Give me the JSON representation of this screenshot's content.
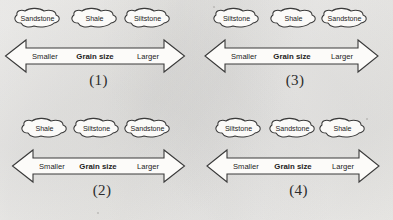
{
  "figure": {
    "background_color": "#f2f1ef",
    "ink_color": "#3a3a3a"
  },
  "axis_labels": {
    "left": "Smaller",
    "center": "Grain size",
    "right": "Larger"
  },
  "panels": [
    {
      "number": "(1)",
      "bubbles": [
        "Sandstone",
        "Shale",
        "Siltstone"
      ],
      "axis": {
        "left": "Smaller",
        "center": "Grain size",
        "right": "Larger"
      }
    },
    {
      "number": "(3)",
      "bubbles": [
        "Siltstone",
        "Shale",
        "Sandstone"
      ],
      "axis": {
        "left": "Smaller",
        "center": "Grain size",
        "right": "Larger"
      }
    },
    {
      "number": "(2)",
      "bubbles": [
        "Shale",
        "Siltstone",
        "Sandstone"
      ],
      "axis": {
        "left": "Smaller",
        "center": "Grain size",
        "right": "Larger"
      }
    },
    {
      "number": "(4)",
      "bubbles": [
        "Siltstone",
        "Sandstone",
        "Shale"
      ],
      "axis": {
        "left": "Smaller",
        "center": "Grain size",
        "right": "Larger"
      }
    }
  ]
}
